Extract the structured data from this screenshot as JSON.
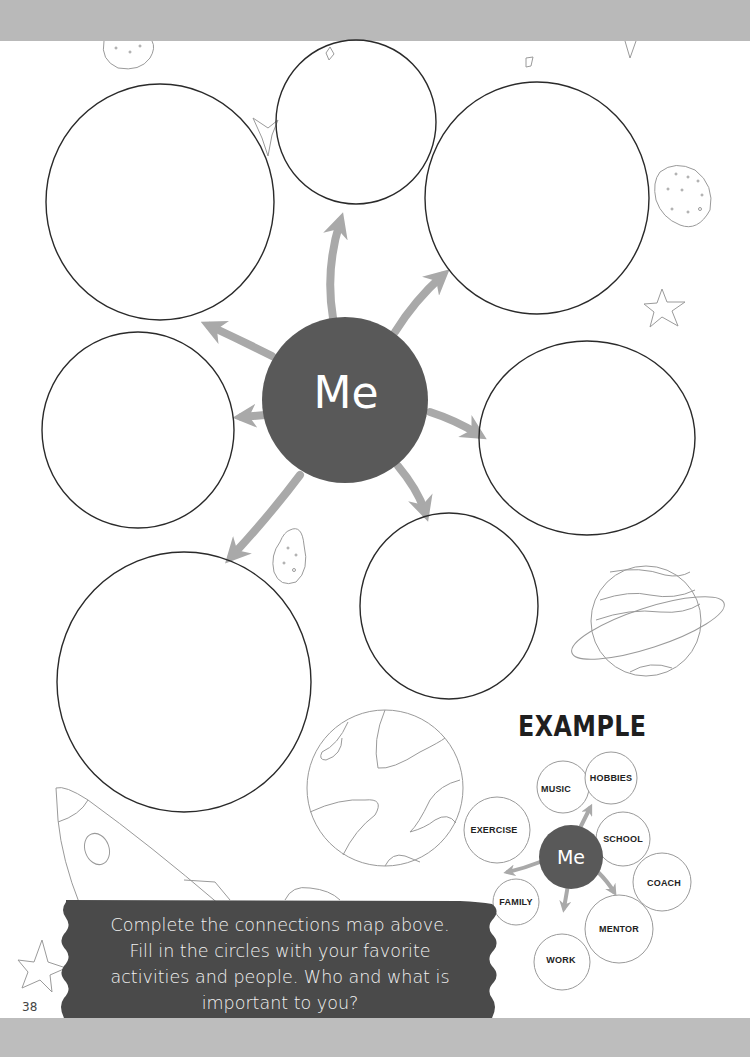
{
  "page": {
    "page_number": "38",
    "center_label": "Me",
    "empty_circles_count": 8,
    "instructions": "Complete the connections map above. Fill in the circles with your favorite activities and people. Who and what is important to you?",
    "instruction_lines": [
      "Complete the connections map above.",
      "Fill in the circles with your favorite",
      "activities and people. Who and what is",
      "important to you?"
    ]
  },
  "example": {
    "title": "EXAMPLE",
    "center_label": "Me",
    "circles": [
      {
        "label": "MUSIC"
      },
      {
        "label": "HOBBIES"
      },
      {
        "label": "EXERCISE"
      },
      {
        "label": "SCHOOL"
      },
      {
        "label": "COACH"
      },
      {
        "label": "FAMILY"
      },
      {
        "label": "MENTOR"
      },
      {
        "label": "WORK"
      }
    ]
  },
  "colors": {
    "center_fill": "#595959",
    "arrow": "#a9a9a9",
    "banner": "#4a4a4a",
    "circle_stroke": "#2a2a2a",
    "decor_stroke": "#9a9a9a"
  }
}
